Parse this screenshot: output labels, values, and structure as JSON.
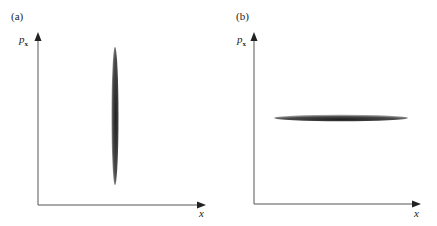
{
  "panels": [
    {
      "label": "(a)",
      "ylabel": "p",
      "ylabel_sub": "x",
      "xlabel": "x",
      "ellipse": {
        "orientation": "vertical",
        "cx": 115,
        "cy": 116,
        "rx": 3.5,
        "ry": 69
      }
    },
    {
      "label": "(b)",
      "ylabel": "p",
      "ylabel_sub": "x",
      "xlabel": "x",
      "ellipse": {
        "orientation": "horizontal",
        "cx": 341,
        "cy": 118,
        "rx": 67,
        "ry": 3.2
      }
    }
  ],
  "colors": {
    "axis": "#555555",
    "ellipse_dark": "#2a2a2a",
    "ellipse_light": "#8a8a8a"
  }
}
